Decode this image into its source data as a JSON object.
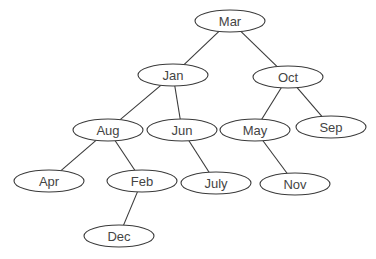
{
  "diagram": {
    "type": "binary-tree",
    "nodes": [
      {
        "id": "mar",
        "label": "Mar",
        "cx": 230,
        "cy": 21
      },
      {
        "id": "jan",
        "label": "Jan",
        "cx": 173,
        "cy": 75
      },
      {
        "id": "oct",
        "label": "Oct",
        "cx": 288,
        "cy": 77
      },
      {
        "id": "aug",
        "label": "Aug",
        "cx": 108,
        "cy": 130
      },
      {
        "id": "jun",
        "label": "Jun",
        "cx": 182,
        "cy": 130
      },
      {
        "id": "may",
        "label": "May",
        "cx": 255,
        "cy": 130
      },
      {
        "id": "sep",
        "label": "Sep",
        "cx": 331,
        "cy": 127
      },
      {
        "id": "apr",
        "label": "Apr",
        "cx": 49,
        "cy": 181
      },
      {
        "id": "feb",
        "label": "Feb",
        "cx": 142,
        "cy": 181
      },
      {
        "id": "july",
        "label": "July",
        "cx": 216,
        "cy": 183
      },
      {
        "id": "nov",
        "label": "Nov",
        "cx": 295,
        "cy": 184
      },
      {
        "id": "dec",
        "label": "Dec",
        "cx": 119,
        "cy": 236
      }
    ],
    "edges": [
      {
        "from": "mar",
        "to": "jan"
      },
      {
        "from": "mar",
        "to": "oct"
      },
      {
        "from": "jan",
        "to": "aug"
      },
      {
        "from": "jan",
        "to": "jun"
      },
      {
        "from": "oct",
        "to": "may"
      },
      {
        "from": "oct",
        "to": "sep"
      },
      {
        "from": "aug",
        "to": "apr"
      },
      {
        "from": "aug",
        "to": "feb"
      },
      {
        "from": "jun",
        "to": "july"
      },
      {
        "from": "may",
        "to": "nov"
      },
      {
        "from": "feb",
        "to": "dec"
      }
    ],
    "node_rx": 35,
    "node_ry": 11
  }
}
